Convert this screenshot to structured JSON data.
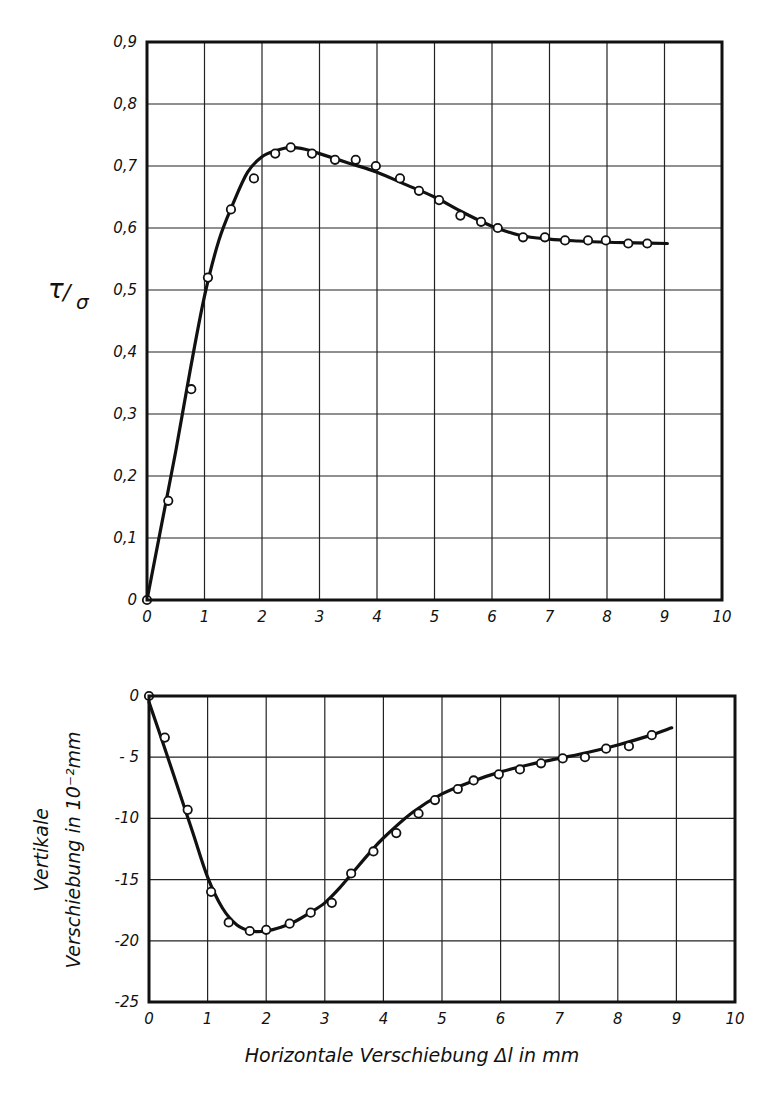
{
  "chart_data": [
    {
      "id": "top",
      "type": "scatter",
      "title": "",
      "xlabel": "",
      "ylabel": "τ/σ",
      "ylabel_main": "τ",
      "ylabel_sub": "σ",
      "xlim": [
        0,
        10
      ],
      "ylim": [
        0,
        0.9
      ],
      "grid": true,
      "legend": null,
      "x_ticks": [
        0,
        1,
        2,
        3,
        4,
        5,
        6,
        7,
        8,
        9,
        10
      ],
      "x_tick_labels": [
        "0",
        "1",
        "2",
        "3",
        "4",
        "5",
        "6",
        "7",
        "8",
        "9",
        "10"
      ],
      "y_ticks": [
        0,
        0.1,
        0.2,
        0.3,
        0.4,
        0.5,
        0.6,
        0.7,
        0.8,
        0.9
      ],
      "y_tick_labels": [
        "0",
        "0,1",
        "0,2",
        "0,3",
        "0,4",
        "0,5",
        "0,6",
        "0,7",
        "0,8",
        "0,9"
      ],
      "series": [
        {
          "name": "measured points",
          "kind": "markers",
          "x": [
            0,
            0.37,
            0.77,
            1.06,
            1.46,
            1.86,
            2.23,
            2.5,
            2.87,
            3.27,
            3.63,
            3.98,
            4.4,
            4.73,
            5.08,
            5.45,
            5.81,
            6.1,
            6.54,
            6.92,
            7.27,
            7.67,
            7.98,
            8.37,
            8.7
          ],
          "y": [
            0,
            0.16,
            0.34,
            0.52,
            0.63,
            0.68,
            0.72,
            0.73,
            0.72,
            0.71,
            0.71,
            0.7,
            0.68,
            0.66,
            0.645,
            0.62,
            0.61,
            0.6,
            0.585,
            0.585,
            0.58,
            0.58,
            0.58,
            0.575,
            0.575
          ]
        },
        {
          "name": "fitted curve",
          "kind": "line",
          "x": [
            0,
            0.25,
            0.5,
            0.75,
            1.0,
            1.25,
            1.5,
            1.75,
            2.0,
            2.25,
            2.5,
            2.75,
            3.0,
            3.5,
            4.0,
            4.5,
            5.0,
            5.5,
            6.0,
            6.5,
            7.0,
            7.5,
            8.0,
            8.5,
            9.05
          ],
          "y": [
            0,
            0.12,
            0.24,
            0.37,
            0.49,
            0.58,
            0.64,
            0.69,
            0.715,
            0.725,
            0.73,
            0.727,
            0.72,
            0.705,
            0.69,
            0.67,
            0.65,
            0.625,
            0.603,
            0.588,
            0.582,
            0.579,
            0.577,
            0.576,
            0.575
          ]
        }
      ]
    },
    {
      "id": "bottom",
      "type": "scatter",
      "title": "",
      "xlabel": "Horizontale Verschiebung Δl in mm",
      "ylabel": "Vertikale Verschiebung in 10⁻²mm",
      "ylabel_line1": "Vertikale",
      "ylabel_line2": "Verschiebung in 10⁻²mm",
      "xlim": [
        0,
        10
      ],
      "ylim": [
        -25,
        0
      ],
      "grid": true,
      "legend": null,
      "x_ticks": [
        0,
        1,
        2,
        3,
        4,
        5,
        6,
        7,
        8,
        9,
        10
      ],
      "x_tick_labels": [
        "0",
        "1",
        "2",
        "3",
        "4",
        "5",
        "6",
        "7",
        "8",
        "9",
        "10"
      ],
      "y_ticks": [
        0,
        -5,
        -10,
        -15,
        -20,
        -25
      ],
      "y_tick_labels": [
        "0",
        "- 5",
        "-10",
        "-15",
        "-20",
        "-25"
      ],
      "series": [
        {
          "name": "measured points",
          "kind": "markers",
          "x": [
            0,
            0.27,
            0.66,
            1.06,
            1.36,
            1.72,
            2.0,
            2.4,
            2.76,
            3.12,
            3.45,
            3.83,
            4.22,
            4.6,
            4.88,
            5.27,
            5.54,
            5.97,
            6.33,
            6.69,
            7.06,
            7.44,
            7.8,
            8.19,
            8.58
          ],
          "y": [
            0,
            -3.4,
            -9.3,
            -16.0,
            -18.5,
            -19.2,
            -19.1,
            -18.6,
            -17.7,
            -16.9,
            -14.5,
            -12.7,
            -11.2,
            -9.6,
            -8.5,
            -7.6,
            -6.9,
            -6.4,
            -6.0,
            -5.5,
            -5.1,
            -5.0,
            -4.3,
            -4.1,
            -3.2
          ]
        },
        {
          "name": "fitted curve",
          "kind": "line",
          "x": [
            0,
            0.25,
            0.5,
            0.75,
            1.0,
            1.25,
            1.5,
            1.75,
            2.0,
            2.25,
            2.5,
            2.75,
            3.0,
            3.25,
            3.5,
            3.75,
            4.0,
            4.5,
            5.0,
            5.5,
            6.0,
            6.5,
            7.0,
            7.5,
            8.0,
            8.5,
            8.92
          ],
          "y": [
            -0.5,
            -4.0,
            -7.6,
            -11.2,
            -14.8,
            -17.3,
            -18.7,
            -19.2,
            -19.2,
            -18.9,
            -18.4,
            -17.7,
            -16.9,
            -15.7,
            -14.3,
            -12.9,
            -11.6,
            -9.5,
            -8.0,
            -7.0,
            -6.2,
            -5.6,
            -5.1,
            -4.6,
            -4.0,
            -3.3,
            -2.6
          ]
        }
      ]
    }
  ],
  "layout": {
    "top_plot": {
      "left": 147,
      "top": 42,
      "right": 722,
      "bottom": 600
    },
    "bottom_plot": {
      "left": 149,
      "top": 696,
      "right": 735,
      "bottom": 1002
    }
  }
}
